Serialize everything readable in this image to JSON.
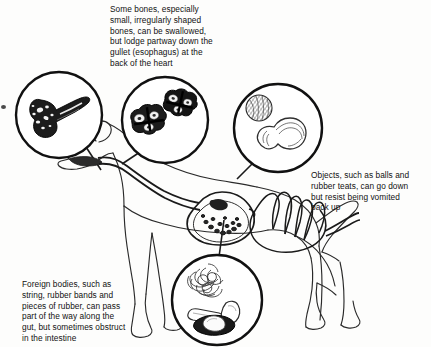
{
  "figure": {
    "background_color": "#ffffff",
    "ink_color": "#111111"
  },
  "captions": {
    "bones": "Some bones, especially\nsmall, irregularly shaped\nbones, can be swallowed,\nbut lodge partway down the\ngullet (esophagus) at the\nback of the heart",
    "objects": "Objects, such as balls and\nrubber teats, can go down\nbut resist being vomited\nback up",
    "foreign_bodies": "Foreign bodies, such as\nstring, rubber bands and\npieces of rubber, can pass\npart of the way along the\ngut, but sometimes obstruct\nin the intestine"
  },
  "callouts": [
    {
      "id": "bone-in-mouth",
      "label": "chop bone",
      "cx": 59,
      "cy": 115,
      "r": 43,
      "leader_to": [
        100,
        168
      ]
    },
    {
      "id": "bones-in-esophagus",
      "label": "two small irregular vertebra bones",
      "cx": 165,
      "cy": 120,
      "r": 43,
      "leader_to": [
        124,
        163
      ]
    },
    {
      "id": "ball-and-teat-in-stomach",
      "label": "ball and rubber teat",
      "cx": 278,
      "cy": 128,
      "r": 44,
      "leader_to": [
        236,
        178
      ]
    },
    {
      "id": "string-and-rubber-in-intestine",
      "label": "string, rubber band and piece of rubber",
      "cx": 217,
      "cy": 300,
      "r": 45,
      "leader_to": [
        224,
        219
      ]
    }
  ],
  "anatomy": {
    "animal": "dog",
    "orientation": "left-facing profile",
    "structures": [
      "mouth",
      "gullet (esophagus)",
      "stomach",
      "intestine"
    ]
  }
}
